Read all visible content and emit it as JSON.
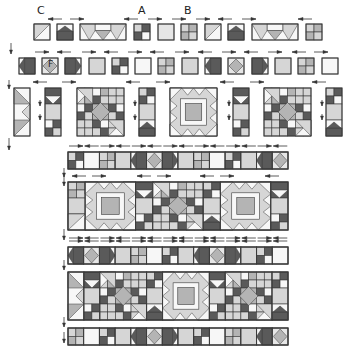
{
  "diagram": {
    "palette": {
      "outline": "#3a3a3a",
      "white": "#f7f7f7",
      "light": "#d6d6d6",
      "medium": "#b4b4b4",
      "dark": "#5a5a5a",
      "pale": "#e6e6e6"
    },
    "unit_labels": [
      {
        "text": "C",
        "x": 37,
        "y": 5
      },
      {
        "text": "A",
        "x": 138,
        "y": 5
      },
      {
        "text": "B",
        "x": 184,
        "y": 5
      },
      {
        "text": "F",
        "x": 48,
        "y": 60
      }
    ],
    "row1_units": [
      {
        "type": "hst",
        "x": 34,
        "y": 24,
        "w": 16,
        "h": 16
      },
      {
        "type": "house",
        "x": 57,
        "y": 24,
        "w": 16,
        "h": 16
      },
      {
        "type": "flyrow",
        "x": 80,
        "y": 24,
        "w": 46,
        "h": 16
      },
      {
        "type": "fourpatch_dark",
        "x": 134,
        "y": 24,
        "w": 16,
        "h": 16
      },
      {
        "type": "plain_light",
        "x": 158,
        "y": 24,
        "w": 16,
        "h": 16
      },
      {
        "type": "fourpatch_light",
        "x": 181,
        "y": 24,
        "w": 16,
        "h": 16
      },
      {
        "type": "hst",
        "x": 205,
        "y": 24,
        "w": 16,
        "h": 16
      },
      {
        "type": "house",
        "x": 228,
        "y": 24,
        "w": 16,
        "h": 16
      },
      {
        "type": "flyrow",
        "x": 252,
        "y": 24,
        "w": 46,
        "h": 16
      },
      {
        "type": "fourpatch_light",
        "x": 306,
        "y": 24,
        "w": 16,
        "h": 16
      }
    ],
    "row1_arrows": [
      {
        "x": 48,
        "y": 19,
        "dir": "left"
      },
      {
        "x": 70,
        "y": 19,
        "dir": "right"
      },
      {
        "x": 124,
        "y": 19,
        "dir": "left"
      },
      {
        "x": 148,
        "y": 19,
        "dir": "right"
      },
      {
        "x": 172,
        "y": 19,
        "dir": "right"
      },
      {
        "x": 196,
        "y": 19,
        "dir": "right"
      },
      {
        "x": 218,
        "y": 19,
        "dir": "left"
      },
      {
        "x": 242,
        "y": 19,
        "dir": "right"
      },
      {
        "x": 298,
        "y": 19,
        "dir": "left"
      }
    ],
    "row2_units": [
      {
        "type": "arrow_left_dark",
        "x": 19,
        "y": 58
      },
      {
        "type": "diamond_f",
        "x": 42,
        "y": 58
      },
      {
        "type": "arrow_right_dark",
        "x": 65,
        "y": 58
      },
      {
        "type": "plain_medium",
        "x": 89,
        "y": 58
      },
      {
        "type": "fourpatch_dark",
        "x": 112,
        "y": 58
      },
      {
        "type": "plain_white",
        "x": 135,
        "y": 58
      },
      {
        "type": "fourpatch_light",
        "x": 158,
        "y": 58
      },
      {
        "type": "plain_medium",
        "x": 182,
        "y": 58
      },
      {
        "type": "arrow_left_dark",
        "x": 205,
        "y": 58
      },
      {
        "type": "diamond",
        "x": 228,
        "y": 58
      },
      {
        "type": "arrow_right_dark",
        "x": 252,
        "y": 58
      },
      {
        "type": "plain_medium",
        "x": 275,
        "y": 58
      },
      {
        "type": "fourpatch_light",
        "x": 298,
        "y": 58
      },
      {
        "type": "plain_white",
        "x": 322,
        "y": 58
      }
    ],
    "row2_arrows": [
      {
        "x": 35,
        "y": 52,
        "dir": "right"
      },
      {
        "x": 57,
        "y": 52,
        "dir": "left"
      },
      {
        "x": 82,
        "y": 52,
        "dir": "right"
      },
      {
        "x": 104,
        "y": 52,
        "dir": "left"
      },
      {
        "x": 128,
        "y": 52,
        "dir": "right"
      },
      {
        "x": 150,
        "y": 52,
        "dir": "left"
      },
      {
        "x": 175,
        "y": 52,
        "dir": "right"
      },
      {
        "x": 198,
        "y": 52,
        "dir": "left"
      },
      {
        "x": 222,
        "y": 52,
        "dir": "right"
      },
      {
        "x": 244,
        "y": 52,
        "dir": "left"
      },
      {
        "x": 268,
        "y": 52,
        "dir": "right"
      },
      {
        "x": 292,
        "y": 52,
        "dir": "left"
      },
      {
        "x": 314,
        "y": 52,
        "dir": "right"
      }
    ],
    "row3_units": [
      {
        "type": "strip_hst_col",
        "x": 14,
        "y": 88,
        "w": 16,
        "h": 48
      },
      {
        "type": "strip_house_col",
        "x": 45,
        "y": 88,
        "w": 16,
        "h": 48
      },
      {
        "type": "block_pinwheel",
        "x": 77,
        "y": 88,
        "w": 47,
        "h": 48
      },
      {
        "type": "strip_house_up_col",
        "x": 139,
        "y": 88,
        "w": 16,
        "h": 48
      },
      {
        "type": "block_star",
        "x": 170,
        "y": 88,
        "w": 47,
        "h": 48
      },
      {
        "type": "strip_house_col",
        "x": 233,
        "y": 88,
        "w": 16,
        "h": 48
      },
      {
        "type": "block_pinwheel",
        "x": 264,
        "y": 88,
        "w": 47,
        "h": 48
      },
      {
        "type": "strip_house_up_col",
        "x": 326,
        "y": 88,
        "w": 16,
        "h": 48
      }
    ],
    "row3_arrows": [
      {
        "x": 33,
        "y": 82,
        "dir": "left"
      },
      {
        "x": 62,
        "y": 82,
        "dir": "right"
      },
      {
        "x": 126,
        "y": 82,
        "dir": "left"
      },
      {
        "x": 156,
        "y": 82,
        "dir": "right"
      },
      {
        "x": 220,
        "y": 82,
        "dir": "left"
      },
      {
        "x": 250,
        "y": 82,
        "dir": "right"
      },
      {
        "x": 312,
        "y": 82,
        "dir": "left"
      }
    ],
    "sashing_strips": [
      {
        "y": 152,
        "cells": [
          "fourpatch_dark",
          "plain_white",
          "fourpatch_light",
          "plain_medium",
          "arrow_left_dark",
          "diamond",
          "arrow_right_dark",
          "plain_medium",
          "fourpatch_light",
          "plain_white",
          "fourpatch_dark",
          "plain_medium",
          "arrow_left_dark",
          "diamond"
        ]
      },
      {
        "y": 247,
        "cells": [
          "arrow_left_dark",
          "diamond",
          "arrow_right_dark",
          "plain_medium",
          "fourpatch_light",
          "plain_white",
          "fourpatch_dark",
          "plain_medium",
          "arrow_left_dark",
          "diamond",
          "arrow_right_dark",
          "plain_medium",
          "fourpatch_dark",
          "plain_white"
        ]
      },
      {
        "y": 328,
        "cells": [
          "fourpatch_light",
          "plain_white",
          "fourpatch_dark",
          "plain_medium",
          "arrow_left_dark",
          "diamond",
          "arrow_right_dark",
          "plain_medium",
          "fourpatch_dark",
          "plain_white",
          "fourpatch_light",
          "plain_medium",
          "arrow_left_dark",
          "diamond"
        ]
      }
    ],
    "strip_arrows_y": [
      146,
      241
    ],
    "block_rows": [
      {
        "y": 182,
        "units": [
          {
            "type": "strip_hst_fp",
            "w": 16
          },
          {
            "type": "block_star",
            "w": 47
          },
          {
            "type": "strip_house_col",
            "w": 16
          },
          {
            "type": "block_pinwheel",
            "w": 47
          },
          {
            "type": "strip_house_up_col",
            "w": 16
          },
          {
            "type": "block_star",
            "w": 47
          },
          {
            "type": "strip_house_col",
            "w": 16
          }
        ]
      },
      {
        "y": 272,
        "units": [
          {
            "type": "strip_hst_col",
            "w": 16
          },
          {
            "type": "strip_house_col",
            "w": 16
          },
          {
            "type": "block_pinwheel",
            "w": 47
          },
          {
            "type": "strip_house_up_col",
            "w": 16
          },
          {
            "type": "block_star",
            "w": 47
          },
          {
            "type": "strip_house_col",
            "w": 16
          },
          {
            "type": "block_pinwheel",
            "w": 47
          },
          {
            "type": "strip_house_up_col",
            "w": 16
          }
        ]
      }
    ],
    "block_row_arrows_y": [
      176
    ],
    "layout": {
      "strip_x": 68,
      "strip_w": 220,
      "strip_h": 17,
      "block_h": 48
    },
    "vertical_arrows": [
      {
        "x": 11,
        "y1": 43,
        "y2": 54
      },
      {
        "x": 9,
        "y1": 80,
        "y2": 89
      },
      {
        "x": 9,
        "y1": 138,
        "y2": 150
      },
      {
        "x": 40,
        "y1": 100,
        "y2": 106
      },
      {
        "x": 40,
        "y1": 114,
        "y2": 120
      },
      {
        "x": 135,
        "y1": 100,
        "y2": 106
      },
      {
        "x": 135,
        "y1": 114,
        "y2": 120
      },
      {
        "x": 229,
        "y1": 100,
        "y2": 106
      },
      {
        "x": 229,
        "y1": 114,
        "y2": 120
      },
      {
        "x": 322,
        "y1": 100,
        "y2": 106
      },
      {
        "x": 322,
        "y1": 114,
        "y2": 120
      },
      {
        "x": 64,
        "y1": 168,
        "y2": 177
      },
      {
        "x": 64,
        "y1": 175,
        "y2": 186
      },
      {
        "x": 64,
        "y1": 229,
        "y2": 240
      },
      {
        "x": 64,
        "y1": 260,
        "y2": 270
      },
      {
        "x": 64,
        "y1": 317,
        "y2": 327
      },
      {
        "x": 64,
        "y1": 332,
        "y2": 343
      }
    ]
  }
}
